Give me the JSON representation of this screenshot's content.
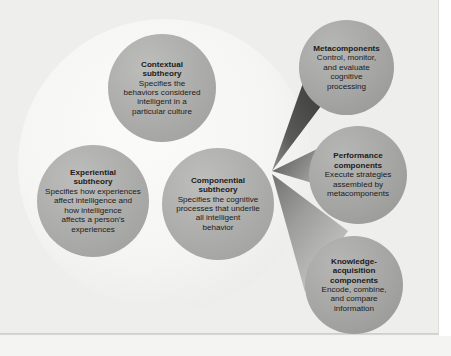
{
  "figure": {
    "background_color": "#eeeeec",
    "outer_ellipse_color": "#f6f6f4",
    "node_fill_color": "#ababa9",
    "component_fill_color": "#a4a4a2",
    "wedge_dark_color": "#4d4d4d",
    "wedge_light_color": "#b5b5b3",
    "text_color": "#1b1b1b"
  },
  "subtheories": [
    {
      "id": "contextual",
      "title": "Contextual\nsubtheory",
      "title_line1": "Contextual",
      "title_line2": "subtheory",
      "description": "Specifies the behaviors considered intelligent in a particular culture",
      "desc_lines": [
        "Specifies the",
        "behaviors considered",
        "intelligent in a",
        "particular culture"
      ]
    },
    {
      "id": "experiential",
      "title": "Experiential\nsubtheory",
      "title_line1": "Experiential",
      "title_line2": "subtheory",
      "description": "Specifies how experiences affect intelligence and how intelligence affects a person's experiences",
      "desc_lines": [
        "Specifies how experiences",
        "affect intelligence and",
        "how intelligence",
        "affects a person's",
        "experiences"
      ]
    },
    {
      "id": "componential",
      "title": "Componential\nsubtheory",
      "title_line1": "Componential",
      "title_line2": "subtheory",
      "description": "Specifies the cognitive processes that underlie all intelligent behavior",
      "desc_lines": [
        "Specifies the cognitive",
        "processes that underlie",
        "all intelligent",
        "behavior"
      ]
    }
  ],
  "components": [
    {
      "id": "metacomponents",
      "title_line1": "Metacomponents",
      "title_line2": "",
      "title_line3": "",
      "description": "Control, monitor, and evaluate cognitive processing",
      "desc_lines": [
        "Control, monitor,",
        "and evaluate",
        "cognitive",
        "processing"
      ]
    },
    {
      "id": "performance-components",
      "title_line1": "Performance",
      "title_line2": "components",
      "title_line3": "",
      "description": "Execute strategies assembled by metacomponents",
      "desc_lines": [
        "Execute strategies",
        "assembled by",
        "metacomponents"
      ]
    },
    {
      "id": "knowledge-acquisition-components",
      "title_line1": "Knowledge-",
      "title_line2": "acquisition",
      "title_line3": "components",
      "description": "Encode, combine, and compare information",
      "desc_lines": [
        "Encode, combine,",
        "and compare",
        "information"
      ]
    }
  ]
}
